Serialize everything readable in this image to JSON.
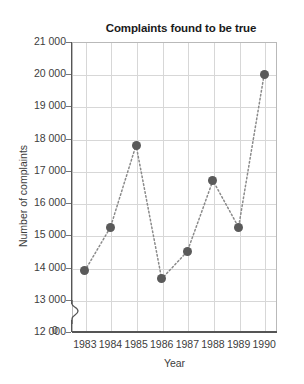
{
  "chart_data": {
    "type": "line",
    "title": "Complaints found to be true",
    "xlabel": "Year",
    "ylabel": "Number of complaints",
    "categories": [
      "1983",
      "1984",
      "1985",
      "1986",
      "1987",
      "1988",
      "1989",
      "1990"
    ],
    "values": [
      13900,
      15250,
      17800,
      13650,
      14500,
      16700,
      15250,
      20000
    ],
    "x": [
      1983,
      1984,
      1985,
      1986,
      1987,
      1988,
      1989,
      1990
    ],
    "ylim": [
      12000,
      21000
    ],
    "y_axis_break": true,
    "y_axis_zero_label": "0",
    "ytick_labels": [
      "21 000",
      "20 000",
      "19 000",
      "18 000",
      "17 000",
      "16 000",
      "15 000",
      "14 000",
      "13 000",
      "12 000"
    ],
    "ytick_values": [
      21000,
      20000,
      19000,
      18000,
      17000,
      16000,
      15000,
      14000,
      13000,
      12000
    ],
    "xtick_labels": [
      "1983",
      "1984",
      "1985",
      "1986",
      "1987",
      "1988",
      "1989",
      "1990"
    ],
    "grid": true,
    "legend": null,
    "legend_position": "none",
    "line_style": "dotted",
    "marker": "circle",
    "marker_color": "#5a5a5a",
    "line_color": "#8a8a8a",
    "grid_color": "#d7d7d7",
    "axis_color": "#555555",
    "background_color": "#ffffff",
    "text_color": "#3d3d3d",
    "title_color": "#1a1a1a"
  }
}
